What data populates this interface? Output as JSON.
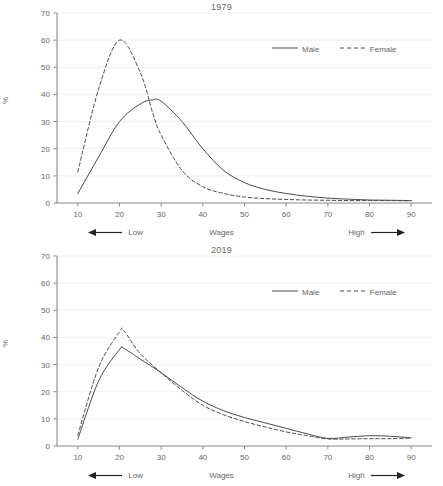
{
  "figure": {
    "axis_label_y": "%",
    "axis_label_x": "Wages",
    "low_label": "Low",
    "high_label": "High",
    "legend": {
      "male": "Male",
      "female": "Female"
    },
    "colors": {
      "line": "#4a4a4a",
      "axis": "#8a8a8a",
      "grid": "#efefef",
      "text": "#666666"
    }
  },
  "chart_data": [
    {
      "type": "line",
      "title": "1979",
      "xlabel": "Wages",
      "ylabel": "%",
      "xlim": [
        5,
        95
      ],
      "ylim": [
        0,
        70
      ],
      "xticks": [
        10,
        20,
        30,
        40,
        50,
        60,
        70,
        80,
        90
      ],
      "yticks": [
        0,
        10,
        20,
        30,
        40,
        50,
        60,
        70
      ],
      "grid": true,
      "legend_position": "top-right",
      "annotations": [
        "Low",
        "High"
      ],
      "x": [
        10,
        15,
        20,
        25,
        28,
        30,
        35,
        40,
        45,
        50,
        55,
        60,
        65,
        70,
        75,
        80,
        85,
        90
      ],
      "series": [
        {
          "name": "Male",
          "style": "solid",
          "values": [
            3.5,
            17,
            30,
            36.5,
            38,
            37.5,
            30,
            20,
            12,
            7.5,
            5,
            3.5,
            2.5,
            1.8,
            1.4,
            1.1,
            1.0,
            0.9
          ]
        },
        {
          "name": "Female",
          "style": "dashed",
          "values": [
            11.5,
            42,
            60,
            48,
            33,
            25,
            12,
            6,
            3.5,
            2.2,
            1.6,
            1.3,
            1.1,
            1.0,
            0.9,
            0.9,
            0.9,
            0.8
          ]
        }
      ]
    },
    {
      "type": "line",
      "title": "2019",
      "xlabel": "Wages",
      "ylabel": "%",
      "xlim": [
        5,
        95
      ],
      "ylim": [
        0,
        70
      ],
      "xticks": [
        10,
        20,
        30,
        40,
        50,
        60,
        70,
        80,
        90
      ],
      "yticks": [
        0,
        10,
        20,
        30,
        40,
        50,
        60,
        70
      ],
      "grid": true,
      "legend_position": "top-right",
      "annotations": [
        "Low",
        "High"
      ],
      "x": [
        10,
        15,
        20,
        21,
        25,
        30,
        35,
        40,
        45,
        50,
        55,
        60,
        65,
        70,
        75,
        80,
        85,
        90
      ],
      "series": [
        {
          "name": "Male",
          "style": "solid",
          "values": [
            2.5,
            24,
            35.5,
            36,
            32,
            27,
            21.5,
            16.5,
            13,
            10.5,
            8.5,
            6.5,
            4.5,
            2.8,
            3.3,
            3.8,
            3.6,
            3.0
          ]
        },
        {
          "name": "Female",
          "style": "dashed",
          "values": [
            4.0,
            29,
            42,
            42.5,
            34,
            27,
            20.5,
            15,
            11.5,
            9,
            7.0,
            5.2,
            3.8,
            2.6,
            2.6,
            2.7,
            2.7,
            2.9
          ]
        }
      ]
    }
  ]
}
